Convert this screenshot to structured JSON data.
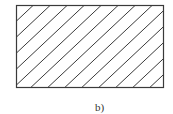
{
  "figure": {
    "caption": "b)",
    "rect": {
      "x": 16.5,
      "y": 5.5,
      "width": 147,
      "height": 82
    },
    "hatch": {
      "spacing": 17,
      "slope": 0.94,
      "direction": "bottom-left-to-top-right",
      "offset": 33
    },
    "colors": {
      "stroke": "#3a3a3a",
      "hatch": "#3a3a3a",
      "background": "#ffffff"
    },
    "stroke_width": 1.2,
    "hatch_width": 1
  }
}
